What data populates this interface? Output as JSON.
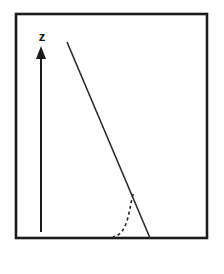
{
  "figure": {
    "name": "boundary-layer-velocity-profile",
    "background_color": "#ffffff",
    "frame": {
      "x": 16,
      "y": 14,
      "width": 191,
      "height": 224,
      "stroke_color": "#1b1b1b",
      "stroke_width": 2.6,
      "fill_color": "#ffffff"
    },
    "axis": {
      "label": "z",
      "label_x": 42,
      "label_y": 41,
      "label_font_size": 13,
      "label_color": "#111111",
      "shaft_x": 41,
      "shaft_top_y": 57,
      "shaft_bottom_y": 232,
      "shaft_width": 2.0,
      "shaft_color": "#1b1b1b",
      "head_tip_y": 46,
      "head_base_y": 59,
      "head_half_width": 5.0,
      "head_color": "#1b1b1b"
    },
    "solid_profile": {
      "name": "linear-profile",
      "x1": 67,
      "y1": 42,
      "x2": 150,
      "y2": 238,
      "stroke_color": "#2a2a2a",
      "stroke_width": 1.6
    },
    "dashed_profile": {
      "name": "boundary-layer-curve",
      "start_x": 133,
      "start_y": 194,
      "control1_x": 128,
      "control1_y": 216,
      "control2_x": 127,
      "control2_y": 234,
      "end_x": 113,
      "end_y": 237,
      "stroke_color": "#2a2a2a",
      "stroke_width": 1.7,
      "dash_pattern": "3,3"
    }
  }
}
